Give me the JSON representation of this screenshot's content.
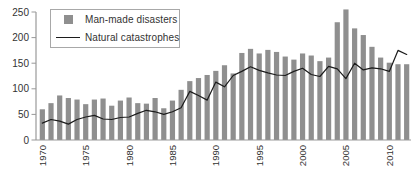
{
  "colors": {
    "bar_fill": "#8f8f8f",
    "line_stroke": "#1c1c1c",
    "axis": "#999999",
    "tick_text": "#333333",
    "legend_border": "#a8a8a8",
    "background": "#ffffff"
  },
  "legend": {
    "items": [
      {
        "label": "Man-made disasters",
        "marker": "square-icon"
      },
      {
        "label": "Natural catastrophes",
        "marker": "line-icon"
      }
    ]
  },
  "chart_data": {
    "type": "bar",
    "title": "",
    "xlabel": "",
    "ylabel": "",
    "grid": false,
    "legend_position": "top-left",
    "ylim": [
      0,
      250
    ],
    "yticks": [
      0,
      50,
      100,
      150,
      200,
      250
    ],
    "xticks": [
      1970,
      1975,
      1980,
      1985,
      1990,
      1995,
      2000,
      2005,
      2010
    ],
    "x": [
      1970,
      1971,
      1972,
      1973,
      1974,
      1975,
      1976,
      1977,
      1978,
      1979,
      1980,
      1981,
      1982,
      1983,
      1984,
      1985,
      1986,
      1987,
      1988,
      1989,
      1990,
      1991,
      1992,
      1993,
      1994,
      1995,
      1996,
      1997,
      1998,
      1999,
      2000,
      2001,
      2002,
      2003,
      2004,
      2005,
      2006,
      2007,
      2008,
      2009,
      2010,
      2011,
      2012
    ],
    "series": [
      {
        "name": "Man-made disasters",
        "render": "bar",
        "color": "#8f8f8f",
        "values": [
          60,
          72,
          87,
          82,
          79,
          70,
          79,
          81,
          67,
          77,
          83,
          72,
          71,
          82,
          62,
          77,
          98,
          115,
          121,
          127,
          135,
          146,
          130,
          170,
          178,
          169,
          176,
          172,
          163,
          157,
          169,
          165,
          154,
          161,
          230,
          255,
          218,
          205,
          182,
          161,
          151,
          148,
          148
        ]
      },
      {
        "name": "Natural catastrophes",
        "render": "line",
        "color": "#1c1c1c",
        "values": [
          33,
          40,
          37,
          31,
          40,
          45,
          48,
          41,
          40,
          44,
          45,
          52,
          58,
          55,
          50,
          55,
          63,
          95,
          87,
          78,
          113,
          104,
          126,
          134,
          143,
          136,
          131,
          127,
          126,
          134,
          140,
          128,
          124,
          144,
          139,
          120,
          150,
          137,
          141,
          139,
          134,
          175,
          167
        ]
      }
    ]
  }
}
